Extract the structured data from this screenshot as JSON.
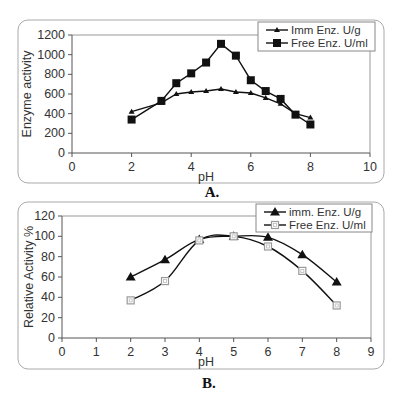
{
  "chart_data": [
    {
      "id": "A",
      "type": "line",
      "caption": "A.",
      "title": "",
      "xlabel": "pH",
      "ylabel": "Enzyme activity",
      "xlim": [
        0,
        10
      ],
      "ylim": [
        0,
        1200
      ],
      "xticks": [
        0,
        2,
        4,
        6,
        8,
        10
      ],
      "yticks": [
        0,
        200,
        400,
        600,
        800,
        1000,
        1200
      ],
      "grid": false,
      "legend_position": "top-right",
      "series": [
        {
          "name": "Imm Enz.  U/g",
          "marker": "triangle-small",
          "x": [
            2,
            3,
            3.5,
            4,
            4.5,
            5,
            5.5,
            6,
            6.5,
            7,
            7.5,
            8
          ],
          "values": [
            420,
            510,
            600,
            620,
            630,
            650,
            620,
            610,
            560,
            500,
            400,
            360
          ]
        },
        {
          "name": "Free Enz. U/ml",
          "marker": "square-filled",
          "x": [
            2,
            3,
            3.5,
            4,
            4.5,
            5,
            5.5,
            6,
            6.5,
            7,
            7.5,
            8
          ],
          "values": [
            340,
            530,
            710,
            810,
            920,
            1110,
            990,
            740,
            630,
            550,
            390,
            290
          ]
        }
      ]
    },
    {
      "id": "B",
      "type": "line",
      "caption": "B.",
      "title": "",
      "xlabel": "pH",
      "ylabel": "Relative Activity %",
      "xlim": [
        0,
        9
      ],
      "ylim": [
        0,
        120
      ],
      "xticks": [
        0,
        1,
        2,
        3,
        4,
        5,
        6,
        7,
        8,
        9
      ],
      "yticks": [
        0,
        20,
        40,
        60,
        80,
        100,
        120
      ],
      "grid": false,
      "legend_position": "top-right",
      "smooth": true,
      "series": [
        {
          "name": "imm. Enz. U/g",
          "marker": "triangle-filled",
          "x": [
            2,
            3,
            4,
            5,
            6,
            7,
            8
          ],
          "values": [
            60,
            77,
            97,
            100,
            99,
            82,
            55
          ]
        },
        {
          "name": "Free Enz. U/ml",
          "marker": "square-open",
          "x": [
            2,
            3,
            4,
            5,
            6,
            7,
            8
          ],
          "values": [
            37,
            56,
            96,
            100,
            90,
            66,
            32
          ]
        }
      ]
    }
  ],
  "layout": {
    "A": {
      "frame": [
        18,
        20,
        366,
        163
      ],
      "plot": [
        72,
        35,
        370,
        153
      ]
    },
    "B": {
      "frame": [
        18,
        2,
        366,
        167
      ],
      "plot": [
        62,
        16,
        371,
        138
      ]
    }
  },
  "colors": {
    "line": "#111111",
    "axis": "#555555",
    "frame": "#aaaaaa",
    "open_marker": "#999999"
  }
}
